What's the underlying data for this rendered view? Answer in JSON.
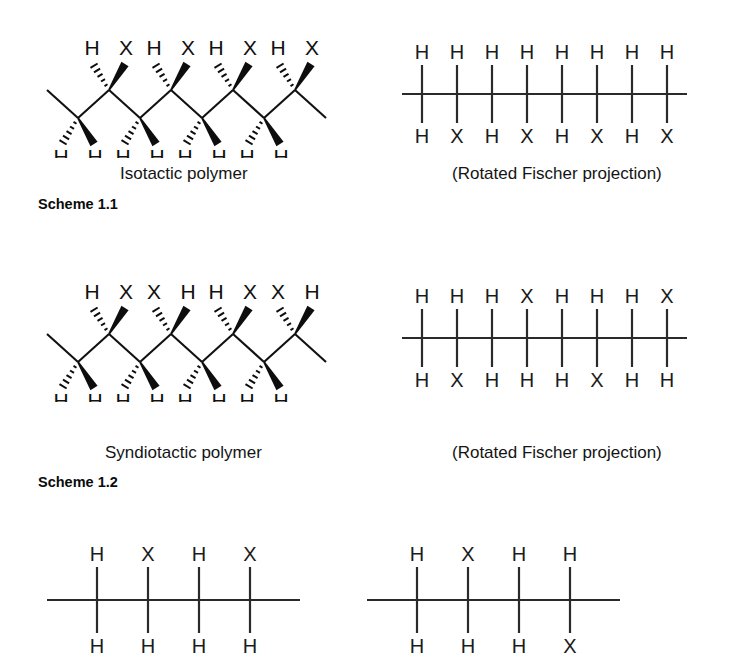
{
  "figure": {
    "background_color": "#ffffff",
    "line_color": "#111111",
    "text_color": "#141414"
  },
  "schemes": [
    {
      "id": "scheme-1-1",
      "label": "Scheme 1.1",
      "caption": "Isotactic polymer",
      "projection_caption": "(Rotated Fischer projection)"
    },
    {
      "id": "scheme-1-2",
      "label": "Scheme 1.2",
      "caption": "Syndiotactic polymer",
      "projection_caption": "(Rotated Fischer projection)"
    }
  ],
  "zigzag_isotactic": {
    "name": "isotactic-zigzag-structure",
    "description": "Zigzag carbon backbone with four up-vertices and four down-vertices",
    "up_vertices": [
      {
        "hash_label": "H",
        "wedge_label": "X"
      },
      {
        "hash_label": "H",
        "wedge_label": "X"
      },
      {
        "hash_label": "H",
        "wedge_label": "X"
      },
      {
        "hash_label": "H",
        "wedge_label": "X"
      }
    ],
    "down_vertices": [
      {
        "hash_label": "H",
        "wedge_label": "H"
      },
      {
        "hash_label": "H",
        "wedge_label": "H"
      },
      {
        "hash_label": "H",
        "wedge_label": "H"
      },
      {
        "hash_label": "H",
        "wedge_label": "H"
      }
    ]
  },
  "zigzag_syndiotactic": {
    "name": "syndiotactic-zigzag-structure",
    "description": "Zigzag carbon backbone with alternating substituent orientation at up-vertices",
    "up_vertices": [
      {
        "hash_label": "H",
        "wedge_label": "X"
      },
      {
        "hash_label": "X",
        "wedge_label": "H"
      },
      {
        "hash_label": "H",
        "wedge_label": "X"
      },
      {
        "hash_label": "X",
        "wedge_label": "H"
      }
    ],
    "down_vertices": [
      {
        "hash_label": "H",
        "wedge_label": "H"
      },
      {
        "hash_label": "H",
        "wedge_label": "H"
      },
      {
        "hash_label": "H",
        "wedge_label": "H"
      },
      {
        "hash_label": "H",
        "wedge_label": "H"
      }
    ]
  },
  "fischer_isotactic": {
    "name": "isotactic-fischer-projection",
    "centers": 8,
    "top_labels": [
      "H",
      "H",
      "H",
      "H",
      "H",
      "H",
      "H",
      "H"
    ],
    "bottom_labels": [
      "H",
      "X",
      "H",
      "X",
      "H",
      "X",
      "H",
      "X"
    ]
  },
  "fischer_syndiotactic": {
    "name": "syndiotactic-fischer-projection",
    "centers": 8,
    "top_labels": [
      "H",
      "H",
      "H",
      "X",
      "H",
      "H",
      "H",
      "X"
    ],
    "bottom_labels": [
      "H",
      "X",
      "H",
      "H",
      "H",
      "X",
      "H",
      "H"
    ]
  },
  "fischer_bottom_left": {
    "name": "bottom-left-fischer-projection",
    "centers": 4,
    "top_labels": [
      "H",
      "X",
      "H",
      "X"
    ],
    "bottom_labels": [
      "H",
      "H",
      "H",
      "H"
    ]
  },
  "fischer_bottom_right": {
    "name": "bottom-right-fischer-projection",
    "centers": 4,
    "top_labels": [
      "H",
      "X",
      "H",
      "H"
    ],
    "bottom_labels": [
      "H",
      "H",
      "H",
      "X"
    ]
  }
}
